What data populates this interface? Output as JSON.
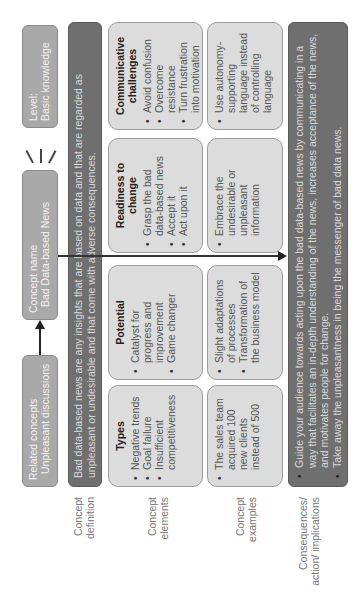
{
  "top_row": {
    "related_concepts": {
      "label": "Related concepts",
      "value": "Unpleasant discussions"
    },
    "concept_name": {
      "label": "Concept name",
      "value": "Bad Data-based News"
    },
    "level": {
      "label": "Level:",
      "value": "Basic knowledge"
    }
  },
  "row_labels": {
    "definition": "Concept definition",
    "elements": "Concept elements",
    "examples": "Concept examples",
    "consequences": "Consequences/ action/ implications"
  },
  "definition": {
    "text": "Bad data-based news are any insights that are based on data and that are regarded as unpleasant or undesirable and that come with adverse consequences."
  },
  "elements": [
    {
      "title": "Types",
      "items": [
        "Negative trends",
        "Goal failure",
        "Insufficient competitiveness"
      ]
    },
    {
      "title": "Potential",
      "items": [
        "Catalyst for progress and improvement",
        "Game changer"
      ]
    },
    {
      "title": "Readiness to change",
      "items": [
        "Grasp the bad data-based news",
        "Accept it",
        "Act upon it"
      ]
    },
    {
      "title": "Communicative challenges",
      "items": [
        "Avoid confusion",
        "Overcome resistance",
        "Turn frustration into motivation"
      ]
    }
  ],
  "examples": [
    {
      "items": [
        "The sales team acquired 100 new clients instead of 500"
      ]
    },
    {
      "items": [
        "Slight adaptations of processes",
        "Transformation of the business model"
      ]
    },
    {
      "items": [
        "Embrace the undesirable or unpleasant information"
      ]
    },
    {
      "items": [
        "Use autonomy-supporting language instead of controlling language"
      ]
    }
  ],
  "consequences": {
    "items": [
      "Guide your audience towards acting upon the bad data-based news by communicating in a way that facilitates an in-depth understanding of the news, increases acceptance of the news, and motivates people for change.",
      "Take away the unpleasantness in being the messenger of bad data news."
    ]
  },
  "colors": {
    "top_box": "#a9a9a9",
    "dark_box": "#6f6f6f",
    "light_box": "#dcdcdc",
    "label_text": "#777777"
  }
}
